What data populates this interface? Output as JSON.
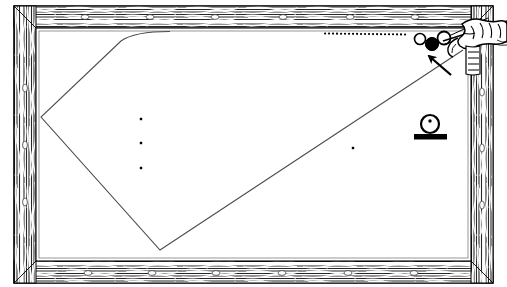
{
  "figure": {
    "kind": "billiard-table-diagram",
    "view": "overhead",
    "title": "",
    "caption": "",
    "width": 507,
    "height": 287
  },
  "colors": {
    "ink": "#000000",
    "cloth": "#ffffff",
    "rail_wood_dark": "#1a1a1a",
    "rail_wood_light": "#e8e6e2",
    "line": "#3a3a3a",
    "sight_marker": "#ffffff",
    "ball_solid": "#000000",
    "ball_open": "#ffffff"
  },
  "table": {
    "outer_frame": {
      "label": "wooden-rail-frame",
      "x": 14,
      "y": 6,
      "width": 479,
      "height": 277,
      "rail_thickness": 22
    },
    "cloth_surface": {
      "label": "playing-surface",
      "x": 36,
      "y": 28,
      "width": 435,
      "height": 233
    },
    "sight_markers": {
      "top": [
        85,
        150,
        215,
        283,
        350,
        415
      ],
      "bottom": [
        88,
        152,
        216,
        282,
        348,
        414
      ],
      "left": [
        88,
        145,
        202
      ],
      "right": [
        92,
        148,
        205
      ],
      "note": "white diamond sights inlaid in rails"
    }
  },
  "shot_path": {
    "label": "cue-ball-trajectory",
    "style": "thin solid polyline",
    "points": [
      {
        "x": 170,
        "y": 31
      },
      {
        "x": 41,
        "y": 117
      },
      {
        "x": 160,
        "y": 250
      },
      {
        "x": 463,
        "y": 50
      }
    ],
    "curve_start": {
      "x": 128,
      "y": 31,
      "note": "rounded at top-left entry"
    }
  },
  "dotted_trail": {
    "label": "ball-travel-dots",
    "from_x": 325,
    "to_x": 410,
    "y": 34,
    "count": 22,
    "description": "dotted line showing ball return along the top rail"
  },
  "balls": [
    {
      "name": "object-ball-open-1",
      "type": "open",
      "cx": 420,
      "cy": 39,
      "r": 5.5
    },
    {
      "name": "object-ball-open-2",
      "type": "open",
      "cx": 444,
      "cy": 38,
      "r": 6.5
    },
    {
      "name": "object-ball-solid",
      "type": "solid",
      "cx": 432,
      "cy": 44,
      "r": 6.5
    }
  ],
  "table_spots": [
    {
      "name": "spot-upper",
      "cx": 141,
      "cy": 119
    },
    {
      "name": "spot-middle",
      "cx": 141,
      "cy": 143
    },
    {
      "name": "spot-lower",
      "cx": 141,
      "cy": 168
    },
    {
      "name": "spot-right",
      "cx": 353,
      "cy": 148
    }
  ],
  "arrow": {
    "label": "direction-arrow",
    "tail": {
      "x": 450,
      "y": 74
    },
    "head": {
      "x": 425,
      "y": 52
    },
    "description": "arrow pointing up-left at the solid ball"
  },
  "cue_and_hand": {
    "label": "hand-bridging-cue",
    "x": 452,
    "y": 14,
    "width": 55,
    "height": 40,
    "cue_tip": {
      "x": 448,
      "y": 40
    },
    "description": "player's hand forming a bridge with the cue stick at the right rail"
  },
  "inset_symbol": {
    "label": "ball-on-rail-key",
    "circle": {
      "cx": 430,
      "cy": 124,
      "r": 9
    },
    "center_dot": {
      "cx": 430,
      "cy": 121,
      "r": 1.6
    },
    "bar": {
      "x": 414,
      "y": 134,
      "width": 33,
      "height": 5
    },
    "description": "key glyph: spotted ball resting on the cushion"
  },
  "annotations": {
    "legend": [],
    "labels": []
  }
}
